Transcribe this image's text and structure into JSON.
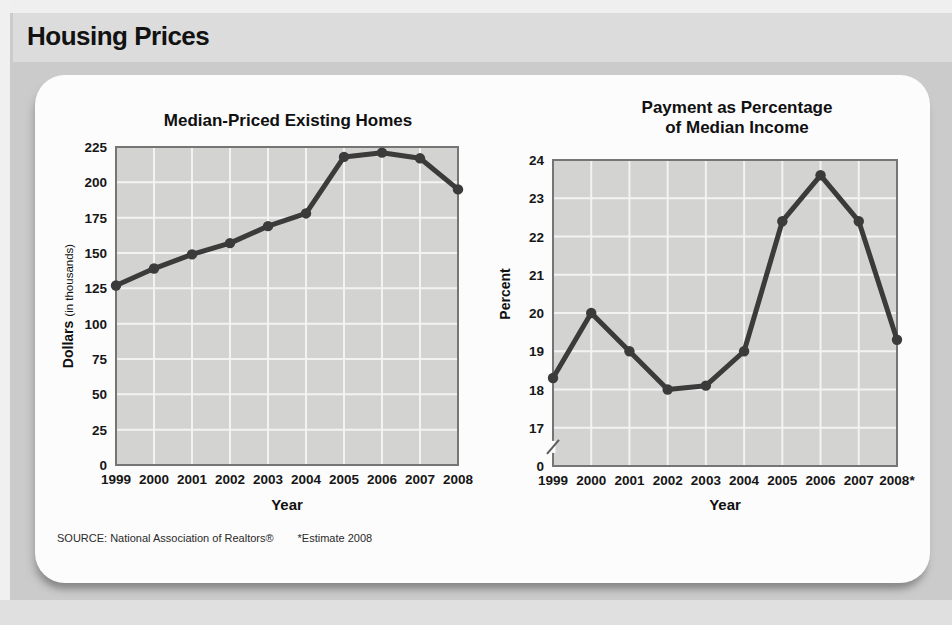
{
  "header": {
    "title": "Housing Prices"
  },
  "source": {
    "label": "SOURCE: National Association of Realtors®",
    "estimate_note": "*Estimate 2008"
  },
  "chart_data": [
    {
      "type": "line",
      "title": "Median-Priced Existing Homes",
      "title_lines": [
        "Median-Priced Existing Homes"
      ],
      "categories": [
        "1999",
        "2000",
        "2001",
        "2002",
        "2003",
        "2004",
        "2005",
        "2006",
        "2007",
        "2008"
      ],
      "values": [
        127,
        139,
        149,
        157,
        169,
        178,
        218,
        221,
        217,
        195
      ],
      "xlabel": "Year",
      "ylabel": "Dollars",
      "ylabel_note": "(in thousands)",
      "ylim": [
        0,
        225
      ],
      "yticks": [
        0,
        25,
        50,
        75,
        100,
        125,
        150,
        175,
        200,
        225
      ],
      "grid": true,
      "legend": "none",
      "colors": {
        "line": "#3b3b3b",
        "plot_bg": "#d3d3d1",
        "grid": "#f3f3f3",
        "border": "#757575"
      }
    },
    {
      "type": "line",
      "title": "Payment as Percentage of Median Income",
      "title_lines": [
        "Payment as Percentage",
        "of Median Income"
      ],
      "categories": [
        "1999",
        "2000",
        "2001",
        "2002",
        "2003",
        "2004",
        "2005",
        "2006",
        "2007",
        "2008*"
      ],
      "values": [
        18.3,
        20,
        19,
        18,
        18.1,
        19,
        22.4,
        23.6,
        22.4,
        19.3
      ],
      "xlabel": "Year",
      "ylabel": "Percent",
      "ylim": [
        0,
        24
      ],
      "ylim_display": [
        17,
        24
      ],
      "yticks": [
        0,
        17,
        18,
        19,
        20,
        21,
        22,
        23,
        24
      ],
      "axis_break": true,
      "grid": true,
      "legend": "none",
      "colors": {
        "line": "#3b3b3b",
        "plot_bg": "#d3d3d1",
        "grid": "#f3f3f3",
        "border": "#757575"
      }
    }
  ]
}
